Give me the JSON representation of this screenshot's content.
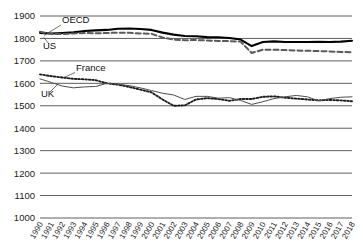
{
  "chart_data": {
    "type": "line",
    "title": "",
    "subtitle": "",
    "xlabel": "",
    "ylabel": "",
    "ylim": [
      1000,
      1900
    ],
    "ytick_step": 100,
    "yticks": [
      1900,
      1800,
      1700,
      1600,
      1500,
      1400,
      1300,
      1200,
      1100,
      1000
    ],
    "grid": true,
    "legend_position": "inline-annotations",
    "x": [
      1990,
      1991,
      1992,
      1993,
      1994,
      1995,
      1996,
      1997,
      1998,
      1999,
      2000,
      2001,
      2002,
      2003,
      2004,
      2005,
      2006,
      2007,
      2008,
      2009,
      2010,
      2011,
      2012,
      2013,
      2014,
      2015,
      2016,
      2017,
      2018
    ],
    "categories": [
      "1990",
      "1991",
      "1992",
      "1993",
      "1994",
      "1995",
      "1996",
      "1997",
      "1998",
      "1999",
      "2000",
      "2001",
      "2002",
      "2003",
      "2004",
      "2005",
      "2006",
      "2007",
      "2008",
      "2009",
      "2010",
      "2011",
      "2012",
      "2013",
      "2014",
      "2015",
      "2016",
      "2017",
      "2018"
    ],
    "series": [
      {
        "name": "OECD",
        "style": "solid-bold",
        "color": "#000000",
        "values": [
          1825,
          1822,
          1824,
          1827,
          1833,
          1836,
          1838,
          1843,
          1844,
          1842,
          1838,
          1826,
          1817,
          1811,
          1810,
          1806,
          1805,
          1802,
          1795,
          1766,
          1784,
          1787,
          1784,
          1784,
          1784,
          1785,
          1784,
          1786,
          1790
        ]
      },
      {
        "name": "US",
        "style": "dashed",
        "color": "#595959",
        "values": [
          1830,
          1820,
          1820,
          1822,
          1824,
          1823,
          1824,
          1826,
          1825,
          1822,
          1821,
          1804,
          1795,
          1792,
          1793,
          1791,
          1789,
          1788,
          1786,
          1735,
          1750,
          1750,
          1748,
          1746,
          1745,
          1744,
          1742,
          1740,
          1738
        ]
      },
      {
        "name": "France",
        "style": "dotted",
        "color": "#1a1a1a",
        "values": [
          1640,
          1632,
          1626,
          1620,
          1618,
          1614,
          1600,
          1594,
          1584,
          1572,
          1560,
          1528,
          1500,
          1502,
          1528,
          1534,
          1530,
          1522,
          1530,
          1530,
          1540,
          1542,
          1536,
          1532,
          1528,
          1524,
          1526,
          1524,
          1520
        ]
      },
      {
        "name": "UK",
        "style": "solid-thin",
        "color": "#4d4d4d",
        "values": [
          1620,
          1604,
          1588,
          1580,
          1584,
          1586,
          1600,
          1596,
          1590,
          1580,
          1568,
          1556,
          1548,
          1528,
          1542,
          1542,
          1534,
          1536,
          1524,
          1506,
          1518,
          1532,
          1540,
          1546,
          1540,
          1522,
          1532,
          1538,
          1540
        ]
      }
    ],
    "annotations": [
      {
        "text": "OECD",
        "series": "OECD"
      },
      {
        "text": "US",
        "series": "US"
      },
      {
        "text": "France",
        "series": "France"
      },
      {
        "text": "UK",
        "series": "UK"
      }
    ]
  }
}
